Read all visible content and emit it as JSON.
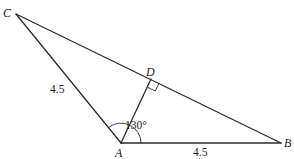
{
  "diagram": {
    "type": "triangle-geometry",
    "vertices": {
      "C": {
        "label": "C",
        "x": 14,
        "y": 13
      },
      "A": {
        "label": "A",
        "x": 121,
        "y": 143
      },
      "B": {
        "label": "B",
        "x": 281,
        "y": 143
      },
      "D": {
        "label": "D",
        "x": 151,
        "y": 79
      }
    },
    "segments": [
      {
        "from": "C",
        "to": "A",
        "length_label": "4.5"
      },
      {
        "from": "A",
        "to": "B",
        "length_label": "4.5"
      },
      {
        "from": "C",
        "to": "B",
        "length_label": ""
      },
      {
        "from": "A",
        "to": "D",
        "length_label": ""
      }
    ],
    "labels": {
      "C": "C",
      "A": "A",
      "B": "B",
      "D": "D",
      "CA_length": "4.5",
      "AB_length": "4.5",
      "angle_CAB": "130°"
    },
    "annotations": {
      "right_angle_at": "D",
      "angle_marked_at": "A",
      "angle_value": "130°"
    },
    "colors": {
      "stroke": "#2b2b2b",
      "text": "#222222",
      "background": "#ffffff"
    }
  }
}
